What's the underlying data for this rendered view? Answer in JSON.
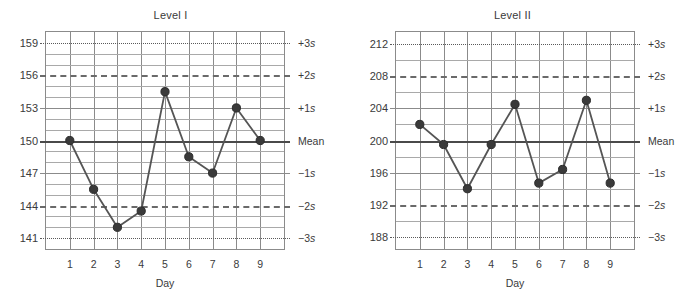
{
  "page": {
    "background": "#ffffff",
    "line_color": "#555555",
    "marker_color": "#3a3a3a",
    "grid_color": "#a9a9a9",
    "axis_color": "#8b8b8b"
  },
  "sigma_labels": [
    "+3s",
    "+2s",
    "+1s",
    "Mean",
    "−1s",
    "−2s",
    "−3s"
  ],
  "x_axis_title": "Day",
  "days": [
    "1",
    "2",
    "3",
    "4",
    "5",
    "6",
    "7",
    "8",
    "9"
  ],
  "chart_data": [
    {
      "type": "line",
      "title": "Level I",
      "xlabel": "Day",
      "ylabel": "",
      "x": [
        1,
        2,
        3,
        4,
        5,
        6,
        7,
        8,
        9
      ],
      "categories": [
        "1",
        "2",
        "3",
        "4",
        "5",
        "6",
        "7",
        "8",
        "9"
      ],
      "values": [
        150,
        145.5,
        142,
        143.5,
        154.5,
        148.5,
        147,
        153,
        150
      ],
      "ylim": [
        140,
        160
      ],
      "ytick_labels": [
        "159",
        "156",
        "153",
        "150",
        "147",
        "144",
        "141"
      ],
      "ytick_values": [
        159,
        156,
        153,
        150,
        147,
        144,
        141
      ],
      "mean": 150,
      "sd": 3,
      "control_limits": {
        "+3s": 159,
        "+2s": 156,
        "+1s": 153,
        "Mean": 150,
        "-1s": 147,
        "-2s": 144,
        "-3s": 141
      },
      "minor_gridline_values": [
        158,
        157,
        155,
        154,
        152,
        151,
        149,
        148,
        146,
        145,
        143,
        142
      ],
      "grid": true,
      "legend": "none"
    },
    {
      "type": "line",
      "title": "Level II",
      "xlabel": "Day",
      "ylabel": "",
      "x": [
        1,
        2,
        3,
        4,
        5,
        6,
        7,
        8,
        9
      ],
      "categories": [
        "1",
        "2",
        "3",
        "4",
        "5",
        "6",
        "7",
        "8",
        "9"
      ],
      "values": [
        202,
        199.5,
        194,
        199.5,
        204.5,
        194.7,
        196.4,
        205,
        194.7
      ],
      "ylim": [
        186.5,
        213.5
      ],
      "ytick_labels": [
        "212",
        "208",
        "204",
        "200",
        "196",
        "192",
        "188"
      ],
      "ytick_values": [
        212,
        208,
        204,
        200,
        196,
        192,
        188
      ],
      "mean": 200,
      "sd": 4,
      "control_limits": {
        "+3s": 212,
        "+2s": 208,
        "+1s": 204,
        "Mean": 200,
        "-1s": 196,
        "-2s": 192,
        "-3s": 188
      },
      "minor_gridline_values": [
        210,
        206,
        202,
        198,
        194,
        190
      ],
      "grid": true,
      "legend": "none"
    }
  ]
}
